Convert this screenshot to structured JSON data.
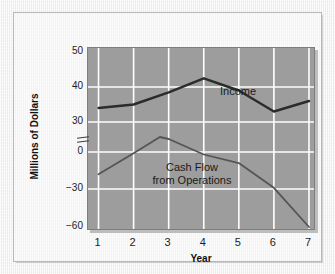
{
  "chart_data": {
    "type": "line",
    "title": "",
    "xlabel": "Year",
    "ylabel": "Millions of Dollars",
    "x": [
      1,
      2,
      3,
      4,
      5,
      6,
      7
    ],
    "xtick_labels": [
      "1",
      "2",
      "3",
      "4",
      "5",
      "6",
      "7"
    ],
    "xlim": [
      0.7,
      7.2
    ],
    "ytick_labels": [
      "50",
      "40",
      "30",
      "0",
      "-30",
      "-60"
    ],
    "ytick_values": [
      50,
      40,
      30,
      0,
      -30,
      -60
    ],
    "y_axis_break": true,
    "y_axis_break_between": [
      30,
      0
    ],
    "grid": true,
    "legend_position": "inline-annotations",
    "plot_background": "#9d9d9d",
    "gridline_color": "#ffffff",
    "series": [
      {
        "name": "Income",
        "label": "Income",
        "color": "#2b2b2b",
        "width": 2.4,
        "values": [
          34,
          35,
          38.5,
          42.5,
          39,
          33,
          36
        ]
      },
      {
        "name": "Cash Flow from Operations",
        "label_line1": "Cash Flow",
        "label_line2": "from Operations",
        "color": "#555555",
        "width": 1.8,
        "values": [
          -18,
          -1,
          13,
          -2,
          -9,
          -29,
          -62
        ],
        "peak_x": 2.75,
        "peak_value": 15
      }
    ]
  },
  "figure": {
    "frame_color": "#b9b8b6",
    "page_background": "#f3f2f0"
  }
}
